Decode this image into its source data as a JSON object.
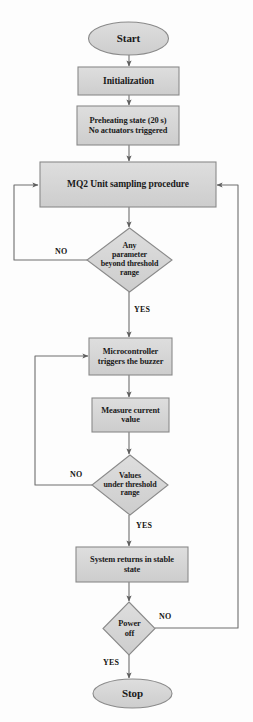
{
  "diagram": {
    "type": "flowchart",
    "colors": {
      "node_fill": "#d3d3d3",
      "node_stroke": "#8a8a8a",
      "line": "#6e6e6e",
      "text": "#1a1a1a",
      "background": "#fdfdfd"
    },
    "nodes": [
      {
        "id": "start",
        "shape": "terminator",
        "text": "Start"
      },
      {
        "id": "init",
        "shape": "process",
        "text": "Initialization"
      },
      {
        "id": "preheat",
        "shape": "process",
        "line1": "Preheating state (20 s)",
        "line2": "No actuators triggered"
      },
      {
        "id": "sampling",
        "shape": "process",
        "text": "MQ2 Unit sampling procedure"
      },
      {
        "id": "decision1",
        "shape": "decision",
        "line1": "Any",
        "line2": "parameter",
        "line3": "beyond  threshold",
        "line4": "range"
      },
      {
        "id": "buzzer",
        "shape": "process",
        "line1": "Microcontroller",
        "line2": "triggers the buzzer"
      },
      {
        "id": "measure",
        "shape": "process",
        "line1": "Measure current",
        "line2": "value"
      },
      {
        "id": "decision2",
        "shape": "decision",
        "line1": "Values",
        "line2": "under threshold",
        "line3": "range"
      },
      {
        "id": "stable",
        "shape": "process",
        "line1": "System returns in stable",
        "line2": "state"
      },
      {
        "id": "decision3",
        "shape": "decision",
        "line1": "Power",
        "line2": "off"
      },
      {
        "id": "stop",
        "shape": "terminator",
        "text": "Stop"
      }
    ],
    "branch_labels": {
      "d1_no": "NO",
      "d1_yes": "YES",
      "d2_no": "NO",
      "d2_yes": "YES",
      "d3_no": "NO",
      "d3_yes": "YES"
    },
    "edges": [
      {
        "from": "start",
        "to": "init",
        "label": ""
      },
      {
        "from": "init",
        "to": "preheat",
        "label": ""
      },
      {
        "from": "preheat",
        "to": "sampling",
        "label": ""
      },
      {
        "from": "sampling",
        "to": "decision1",
        "label": ""
      },
      {
        "from": "decision1",
        "to": "sampling",
        "label": "NO"
      },
      {
        "from": "decision1",
        "to": "buzzer",
        "label": "YES"
      },
      {
        "from": "buzzer",
        "to": "measure",
        "label": ""
      },
      {
        "from": "measure",
        "to": "decision2",
        "label": ""
      },
      {
        "from": "decision2",
        "to": "buzzer",
        "label": "NO"
      },
      {
        "from": "decision2",
        "to": "stable",
        "label": "YES"
      },
      {
        "from": "stable",
        "to": "decision3",
        "label": ""
      },
      {
        "from": "decision3",
        "to": "sampling",
        "label": "NO"
      },
      {
        "from": "decision3",
        "to": "stop",
        "label": "YES"
      }
    ]
  }
}
